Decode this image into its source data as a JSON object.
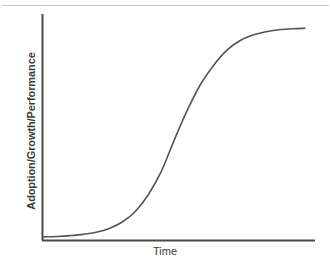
{
  "figure": {
    "width": 330,
    "height": 262,
    "background": "#ffffff",
    "top_rule_color": "#c9c9c9"
  },
  "axes": {
    "y_label": "Adoption/Growth/Performance",
    "x_label": "Time",
    "axis_color": "#4a4a4a",
    "label_color": "#3b3b3b",
    "x_axis": {
      "x_start": 42,
      "x_end": 315,
      "y": 240
    },
    "y_axis": {
      "x": 42,
      "y_top": 14,
      "y_bottom": 240
    }
  },
  "curve": {
    "color": "#555555",
    "width": 1.6,
    "name": "s-curve",
    "path": "M 44 239 C 70 239, 92 238, 112 226 C 134 213, 152 182, 172 142 C 190 105, 206 72, 226 53 C 248 32, 272 27, 290 27 L 305 27"
  },
  "chart_data": {
    "type": "line",
    "title": "",
    "subtitle": "",
    "xlabel": "Time",
    "ylabel": "Adoption/Growth/Performance",
    "grid": false,
    "legend": false,
    "legend_position": "none",
    "xlim": [
      0,
      1
    ],
    "ylim": [
      0,
      1
    ],
    "xticks": [],
    "yticks": [],
    "xticklabels": [],
    "yticklabels": [],
    "annotations": [],
    "series": [
      {
        "name": "S-curve (sigmoid adoption)",
        "color": "#555555",
        "x": [
          0.0,
          0.05,
          0.1,
          0.15,
          0.2,
          0.25,
          0.3,
          0.35,
          0.4,
          0.45,
          0.5,
          0.55,
          0.6,
          0.65,
          0.7,
          0.75,
          0.8,
          0.85,
          0.9,
          0.95,
          1.0
        ],
        "y": [
          0.01,
          0.012,
          0.016,
          0.022,
          0.032,
          0.05,
          0.08,
          0.13,
          0.21,
          0.32,
          0.47,
          0.61,
          0.73,
          0.82,
          0.89,
          0.935,
          0.962,
          0.978,
          0.987,
          0.992,
          0.994
        ]
      }
    ]
  }
}
